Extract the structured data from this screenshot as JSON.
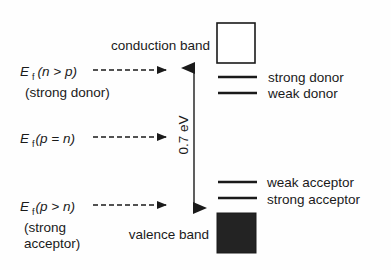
{
  "diagram": {
    "bands": {
      "conduction": {
        "label": "conduction band",
        "fill": "#ffffff",
        "stroke": "#1a1a1a"
      },
      "valence": {
        "label": "valence band",
        "fill": "#232323",
        "stroke": "#1a1a1a"
      }
    },
    "gap": {
      "label": "0.7 eV"
    },
    "levels": [
      {
        "name": "strong donor",
        "label": "strong donor"
      },
      {
        "name": "weak donor",
        "label": "weak donor"
      },
      {
        "name": "weak acceptor",
        "label": "weak acceptor"
      },
      {
        "name": "strong acceptor",
        "label": "strong acceptor"
      }
    ],
    "fermi_levels": [
      {
        "symbol": "E",
        "subscript": "f",
        "condition": "(n > p)",
        "note_lines": [
          "(strong donor)"
        ]
      },
      {
        "symbol": "E",
        "subscript": "f",
        "condition": "(p = n)",
        "note_lines": []
      },
      {
        "symbol": "E",
        "subscript": "f",
        "condition": "(p > n)",
        "note_lines": [
          "(strong",
          "acceptor)"
        ]
      }
    ],
    "colors": {
      "ink": "#1a1a1a",
      "background": "#fefefe"
    }
  }
}
